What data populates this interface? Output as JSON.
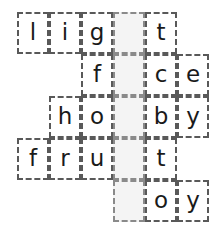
{
  "puzzle": {
    "type": "letter-grid-word-puzzle",
    "title": "Word completion grid",
    "geometry": {
      "origin_x": 17,
      "origin_y": 12,
      "cell_width": 32,
      "cell_height": 42,
      "columns": 6,
      "rows": 5
    },
    "colors": {
      "border": "#595959",
      "shaded_fill": "#f4f4f4",
      "shaded_border": "#8a8a8a",
      "letter": "#1a1a1a",
      "page_background": "#ffffff"
    },
    "shaded_column_index": 3,
    "rows": [
      {
        "index": 0,
        "word": "light",
        "start_col": 0,
        "cells": [
          {
            "col": 0,
            "letter": "l",
            "shaded": false
          },
          {
            "col": 1,
            "letter": "i",
            "shaded": false
          },
          {
            "col": 2,
            "letter": "g",
            "shaded": false
          },
          {
            "col": 3,
            "letter": "h",
            "shaded": true
          },
          {
            "col": 4,
            "letter": "t",
            "shaded": false
          }
        ]
      },
      {
        "index": 1,
        "word": "face",
        "start_col": 2,
        "cells": [
          {
            "col": 2,
            "letter": "f",
            "shaded": false
          },
          {
            "col": 3,
            "letter": "a",
            "shaded": true
          },
          {
            "col": 4,
            "letter": "c",
            "shaded": false
          },
          {
            "col": 5,
            "letter": "e",
            "shaded": false
          }
        ]
      },
      {
        "index": 2,
        "word": "hobby",
        "start_col": 1,
        "cells": [
          {
            "col": 1,
            "letter": "h",
            "shaded": false
          },
          {
            "col": 2,
            "letter": "o",
            "shaded": false
          },
          {
            "col": 3,
            "letter": "b",
            "shaded": true
          },
          {
            "col": 4,
            "letter": "b",
            "shaded": false
          },
          {
            "col": 5,
            "letter": "y",
            "shaded": false
          }
        ]
      },
      {
        "index": 3,
        "word": "fruit",
        "start_col": 0,
        "cells": [
          {
            "col": 0,
            "letter": "f",
            "shaded": false
          },
          {
            "col": 1,
            "letter": "r",
            "shaded": false
          },
          {
            "col": 2,
            "letter": "u",
            "shaded": false
          },
          {
            "col": 3,
            "letter": "i",
            "shaded": true
          },
          {
            "col": 4,
            "letter": "t",
            "shaded": false
          }
        ]
      },
      {
        "index": 4,
        "word": "boy",
        "start_col": 3,
        "cells": [
          {
            "col": 3,
            "letter": "b",
            "shaded": true
          },
          {
            "col": 4,
            "letter": "o",
            "shaded": false
          },
          {
            "col": 5,
            "letter": "y",
            "shaded": false
          }
        ]
      }
    ]
  }
}
